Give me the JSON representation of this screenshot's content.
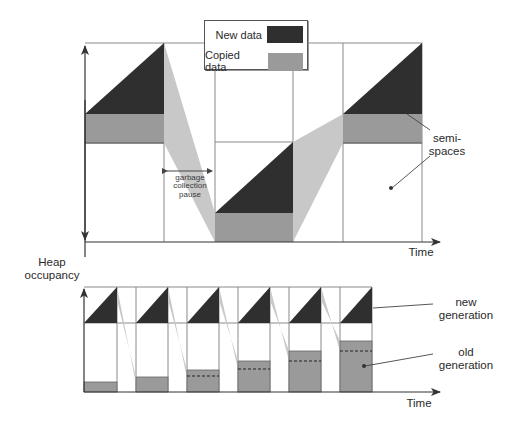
{
  "colors": {
    "new_data": "#2f2f2f",
    "copied_data": "#9a9a9a",
    "copy_flow": "#c8c8c8",
    "grid": "#8a8a8a",
    "axis": "#333333"
  },
  "legend": {
    "items": [
      {
        "label": "New data",
        "swatch": "new_data"
      },
      {
        "label": "Copied data",
        "swatch": "copied_data"
      }
    ]
  },
  "labels": {
    "y_axis": "Heap occupancy",
    "y_axis_line1": "Heap",
    "y_axis_line2": "occupancy",
    "top_time": "Time",
    "bottom_time": "Time",
    "gc_pause_line1": "garbage",
    "gc_pause_line2": "collection",
    "gc_pause_line3": "pause",
    "semi_spaces_line1": "semi-",
    "semi_spaces_line2": "spaces",
    "new_gen_line1": "new",
    "new_gen_line2": "generation",
    "old_gen_line1": "old",
    "old_gen_line2": "generation"
  },
  "top_panel": {
    "title": "Semi-space copying collector",
    "columns_x": [
      85,
      164,
      215,
      293,
      343,
      422
    ],
    "phases": [
      {
        "space": "upper",
        "x0": 85,
        "x1": 164,
        "copied_top": 114,
        "copied_bottom": 143,
        "new_apex_y": 43
      },
      {
        "space": "lower",
        "x0": 215,
        "x1": 293,
        "copied_top": 213,
        "copied_bottom": 242,
        "new_apex_y": 142
      },
      {
        "space": "upper",
        "x0": 343,
        "x1": 422,
        "copied_top": 114,
        "copied_bottom": 143,
        "new_apex_y": 43
      }
    ]
  },
  "bottom_panel": {
    "title": "Generational collector",
    "blocks": [
      {
        "x0": 84,
        "x1": 117,
        "old_top": 382,
        "old_dashed": null
      },
      {
        "x0": 136,
        "x1": 168,
        "old_top": 377,
        "old_dashed": null
      },
      {
        "x0": 187,
        "x1": 219,
        "old_top": 370,
        "old_dashed": 376
      },
      {
        "x0": 238,
        "x1": 270,
        "old_top": 361,
        "old_dashed": 369
      },
      {
        "x0": 289,
        "x1": 321,
        "old_top": 351,
        "old_dashed": 361
      },
      {
        "x0": 340,
        "x1": 372,
        "old_top": 341,
        "old_dashed": 351
      }
    ]
  }
}
